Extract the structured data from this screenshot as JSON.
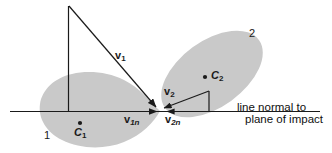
{
  "figure": {
    "colors": {
      "body_fill": "#c9c9c9",
      "stroke": "#1a1a1a",
      "background": "#ffffff",
      "text": "#1a1a1a"
    },
    "bodies": [
      {
        "id": "body-1",
        "number_label": "1",
        "centroid_label": "C",
        "centroid_subscript": "1"
      },
      {
        "id": "body-2",
        "number_label": "2",
        "centroid_label": "C",
        "centroid_subscript": "2"
      }
    ],
    "vectors": [
      {
        "id": "v1",
        "label": "v",
        "subscript": "1",
        "description": "incoming velocity of body 1"
      },
      {
        "id": "v1n",
        "label": "v",
        "subscript": "1n",
        "description": "normal component of velocity of body 1"
      },
      {
        "id": "v2",
        "label": "v",
        "subscript": "2",
        "description": "velocity of body 2"
      },
      {
        "id": "v2n",
        "label": "v",
        "subscript": "2n",
        "description": "normal component of velocity of body 2"
      }
    ],
    "caption": {
      "line1": "line normal to",
      "line2": "plane of impact"
    }
  }
}
